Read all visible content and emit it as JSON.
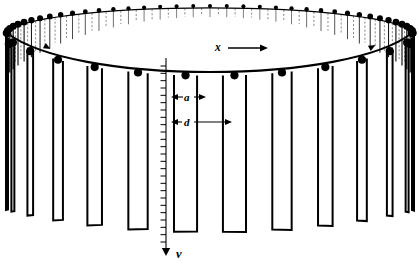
{
  "figure": {
    "name": "rotating-slatted-drum-diagram",
    "type": "technical-line-diagram",
    "background_color": "#ffffff",
    "ink_color": "#000000",
    "width": 419,
    "height": 266
  },
  "labels": {
    "slat_width": "a",
    "pitch": "d",
    "horizontal_axis": "x",
    "velocity": "v"
  },
  "chart_data": {
    "type": "diagram",
    "title": "",
    "annotations": [
      {
        "text": "x",
        "meaning": "horizontal-direction-arrow",
        "x": 214,
        "y": 48,
        "arrow": "right"
      },
      {
        "text": "a",
        "meaning": "slat-width-dimension",
        "x": 186,
        "y": 99,
        "arrow": "double"
      },
      {
        "text": "d",
        "meaning": "slat-pitch-dimension",
        "x": 186,
        "y": 124,
        "arrow": "double"
      },
      {
        "text": "v",
        "meaning": "downward-velocity-arrow",
        "x": 178,
        "y": 254,
        "arrow": "down"
      }
    ],
    "geometry": {
      "near_rim_dot_count": 11,
      "far_rim_dot_count": 38,
      "near_slat_count": 13,
      "far_slat_count": 38,
      "ruler_tick_count": 25,
      "ellipse_center_x": 210,
      "ellipse_center_y": 33,
      "ellipse_rx": 203,
      "ellipse_ry": 27,
      "near_rim_center_y": 58,
      "drum_bottom_y": 232
    }
  }
}
